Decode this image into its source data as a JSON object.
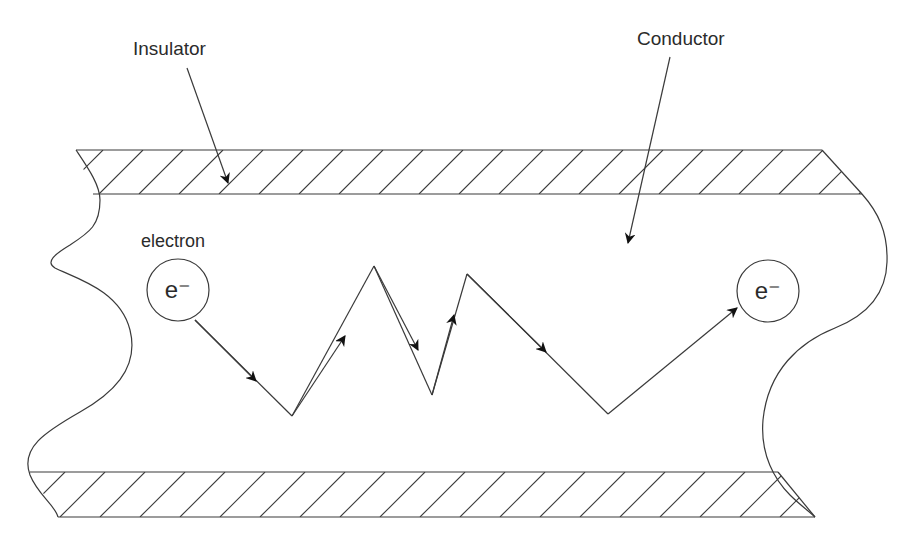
{
  "diagram": {
    "type": "conductor-electron-path",
    "labels": {
      "insulator": "Insulator",
      "conductor": "Conductor",
      "electron": "electron"
    },
    "particles": [
      {
        "id": "start",
        "symbol": "e⁻"
      },
      {
        "id": "end",
        "symbol": "e⁻"
      }
    ],
    "path_description": "Electron zigzags through conductor between insulator layers",
    "colors": {
      "line": "#3a3a3a",
      "text": "#2b2b2b",
      "background": "#ffffff"
    }
  }
}
